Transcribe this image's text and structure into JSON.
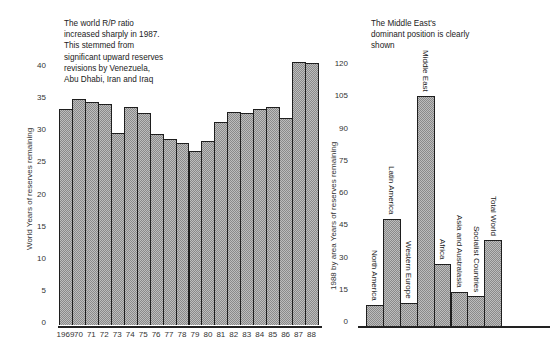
{
  "chart_data": [
    {
      "type": "bar",
      "title": "",
      "annotation": "The world R/P ratio\nincreased sharply in 1987.\nThis stemmed from\nsignificant upward reserves\nrevisions by Venezuela,\nAbu Dhabi, Iran and Iraq",
      "xlabel": "",
      "ylabel": "World  Years of reserves remaining",
      "ylim": [
        0,
        40
      ],
      "yticks": [
        0,
        5,
        10,
        15,
        20,
        25,
        30,
        35,
        40
      ],
      "grid": false,
      "categories": [
        "1969",
        "70",
        "71",
        "72",
        "73",
        "74",
        "75",
        "76",
        "77",
        "78",
        "79",
        "80",
        "81",
        "82",
        "83",
        "84",
        "85",
        "86",
        "87",
        "88"
      ],
      "values": [
        33.3,
        34.9,
        34.4,
        34.1,
        29.5,
        33.6,
        32.7,
        29.4,
        28.6,
        28.0,
        26.7,
        28.3,
        31.3,
        32.8,
        32.7,
        33.3,
        33.6,
        31.9,
        40.7,
        40.4
      ]
    },
    {
      "type": "bar",
      "title": "",
      "annotation": "The Middle East's\ndominant position is clearly\nshown",
      "xlabel": "",
      "ylabel": "1988 by area  Years of reserves remaining",
      "ylim": [
        0,
        120
      ],
      "yticks": [
        0,
        15,
        30,
        45,
        60,
        75,
        90,
        105,
        120
      ],
      "grid": false,
      "categories": [
        "North America",
        "Latin America",
        "Western Europe",
        "Middle East",
        "Africa",
        "Asia and Australasia",
        "Socialist Countries",
        "Total World"
      ],
      "values": [
        8,
        48,
        9,
        105,
        27,
        14,
        12,
        38
      ]
    }
  ],
  "colors": {
    "bar_fill": "#bdbdbd",
    "bar_border": "#1e1e1e",
    "text": "#222222"
  }
}
